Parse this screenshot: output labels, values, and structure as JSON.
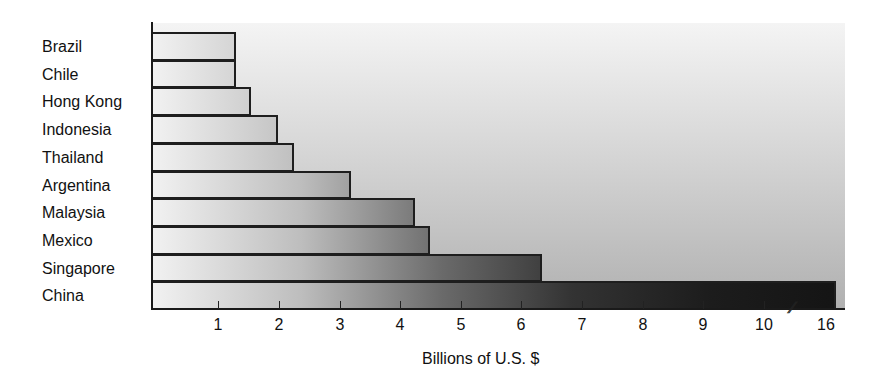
{
  "chart_data": {
    "type": "bar",
    "orientation": "horizontal",
    "title": "",
    "xlabel": "Billions of U.S. $",
    "ylabel": "",
    "categories": [
      "Brazil",
      "Chile",
      "Hong Kong",
      "Indonesia",
      "Thailand",
      "Argentina",
      "Malaysia",
      "Mexico",
      "Singapore",
      "China"
    ],
    "values": [
      1.3,
      1.3,
      1.55,
      2.0,
      2.25,
      3.2,
      4.25,
      4.5,
      6.35,
      16.2
    ],
    "x_ticks": [
      "1",
      "2",
      "3",
      "4",
      "5",
      "6",
      "7",
      "8",
      "9",
      "10",
      "16"
    ],
    "xlim": [
      0,
      16.3
    ],
    "axis_break": {
      "between": [
        10,
        16
      ],
      "marker": "//"
    },
    "grid": false,
    "legend": null,
    "bar_fill": "horizontal gradient light-to-dark grey",
    "background": "vertical gradient light grey"
  },
  "labels": {
    "categories": [
      "Brazil",
      "Chile",
      "Hong Kong",
      "Indonesia",
      "Thailand",
      "Argentina",
      "Malaysia",
      "Mexico",
      "Singapore",
      "China"
    ],
    "ticks": [
      "1",
      "2",
      "3",
      "4",
      "5",
      "6",
      "7",
      "8",
      "9",
      "10",
      "16"
    ],
    "axis_break_marker": "//",
    "x_title": "Billions of U.S. $"
  }
}
